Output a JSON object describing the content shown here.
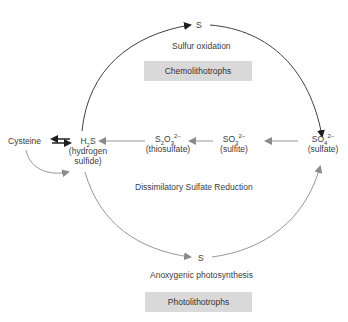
{
  "diagram": {
    "top": {
      "node": "S",
      "process": "Sulfur oxidation",
      "organism_box": "Chemolithotrophs"
    },
    "bottom": {
      "node": "S",
      "process": "Anoxygenic photosynthesis",
      "organism_box": "Photolithotrophs"
    },
    "middle": {
      "process": "Dissimilatory Sulfate Reduction"
    },
    "nodes": {
      "cysteine": "Cysteine",
      "h2s": {
        "formula_base": "H",
        "formula_sub": "2",
        "formula_tail": "S",
        "name_line1": "(hydrogen",
        "name_line2": "sulfide)"
      },
      "thiosulfate": {
        "f1": "S",
        "s1": "2",
        "f2": "O",
        "s2": "3",
        "charge": "2−",
        "name": "(thiosulfate)"
      },
      "sulfite": {
        "f1": "SO",
        "s1": "3",
        "charge": "2−",
        "name": "(sulfite)"
      },
      "sulfate": {
        "f1": "SO",
        "s1": "4",
        "charge": "2−",
        "name": "(sulfate)"
      }
    },
    "colors": {
      "oxidation_arrow": "#222222",
      "reduction_arrow": "#888888",
      "box_fill": "#d9d9d9",
      "text": "#3c3c3c"
    }
  }
}
